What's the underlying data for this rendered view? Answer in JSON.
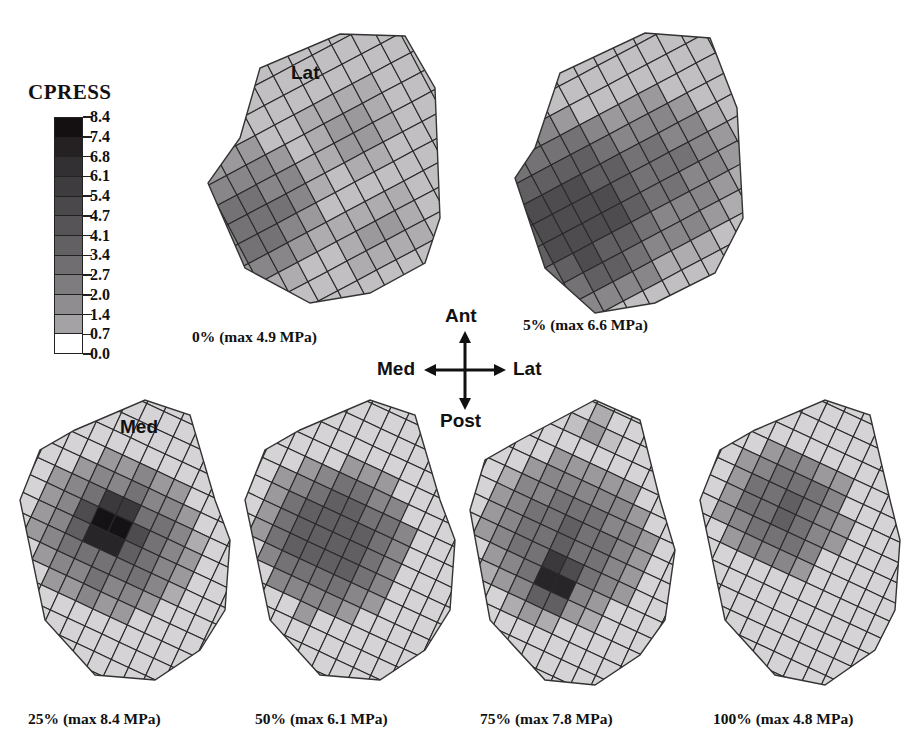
{
  "legend": {
    "title": "CPRESS",
    "unit": "MPa",
    "labels": [
      "8.4",
      "7.4",
      "6.8",
      "6.1",
      "5.4",
      "4.7",
      "4.1",
      "3.4",
      "2.7",
      "2.0",
      "1.4",
      "0.7",
      "0.0"
    ],
    "band_colors": [
      "#141012",
      "#252022",
      "#333033",
      "#3f3c3f",
      "#4b484b",
      "#575457",
      "#636063",
      "#716e71",
      "#7f7c7f",
      "#8f8d8f",
      "#a4a2a4",
      "#ffffff"
    ]
  },
  "orientation": {
    "up": "Ant",
    "down": "Post",
    "left": "Med",
    "right": "Lat"
  },
  "panels": [
    {
      "id": "p0",
      "caption": "0% (max 4.9 MPa)",
      "inner_label": "Lat",
      "max_mpa": 4.9
    },
    {
      "id": "p5",
      "caption": "5% (max 6.6 MPa)",
      "inner_label": "",
      "max_mpa": 6.6
    },
    {
      "id": "p25",
      "caption": "25% (max 8.4 MPa)",
      "inner_label": "Med",
      "max_mpa": 8.4
    },
    {
      "id": "p50",
      "caption": "50% (max 6.1 MPa)",
      "inner_label": "",
      "max_mpa": 6.1
    },
    {
      "id": "p75",
      "caption": "75% (max 7.8 MPa)",
      "inner_label": "",
      "max_mpa": 7.8
    },
    {
      "id": "p100",
      "caption": "100% (max 4.8 MPa)",
      "inner_label": "",
      "max_mpa": 4.8
    }
  ],
  "chart_data": {
    "type": "heatmap",
    "title": "CPRESS",
    "colorbar": {
      "label": "CPRESS",
      "ticks": [
        0.0,
        0.7,
        1.4,
        2.0,
        2.7,
        3.4,
        4.1,
        4.7,
        5.4,
        6.1,
        6.8,
        7.4,
        8.4
      ],
      "range": [
        0.0,
        8.4
      ]
    },
    "categories": [
      "0%",
      "5%",
      "25%",
      "50%",
      "75%",
      "100%"
    ],
    "series": [
      {
        "name": "max contact pressure (MPa)",
        "values": [
          4.9,
          6.6,
          8.4,
          6.1,
          7.8,
          4.8
        ]
      }
    ],
    "annotations": [
      "Lat",
      "Med",
      "Ant",
      "Post",
      "Med",
      "Lat"
    ]
  }
}
